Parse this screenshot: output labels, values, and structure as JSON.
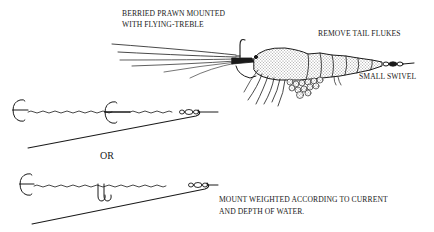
{
  "figure": {
    "type": "line-illustration",
    "ink_color": "#1a1a1a",
    "background": "#ffffff"
  },
  "labels": {
    "prawn_title_line1": "BERRIED PRAWN MOUNTED",
    "prawn_title_line2": "WITH FLYING-TREBLE",
    "remove_tail": "REMOVE TAIL FLUKES",
    "swivel": "SMALL SWIVEL",
    "or": "OR",
    "weighted_line1": "MOUNT WEIGHTED ACCORDING TO CURRENT",
    "weighted_line2": "AND DEPTH OF WATER."
  },
  "components": {
    "top": "prawn",
    "middle": "two-treble-mount",
    "bottom": "treble-and-double-hook-mount"
  }
}
